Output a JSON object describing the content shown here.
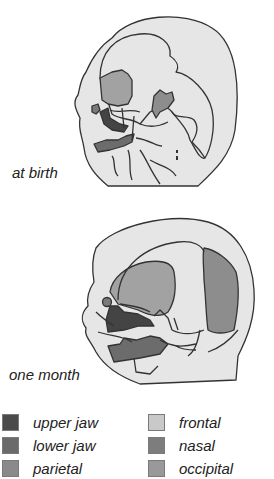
{
  "figure": {
    "stages": [
      {
        "id": "birth",
        "caption": "at birth"
      },
      {
        "id": "month",
        "caption": "one month"
      }
    ]
  },
  "legend": {
    "items": [
      {
        "label": "upper jaw",
        "color": "#4a4a4a"
      },
      {
        "label": "lower jaw",
        "color": "#6a6a6a"
      },
      {
        "label": "parietal",
        "color": "#8a8a8a"
      },
      {
        "label": "frontal",
        "color": "#c9c9c9"
      },
      {
        "label": "nasal",
        "color": "#7d7d7d"
      },
      {
        "label": "occipital",
        "color": "#999999"
      }
    ]
  },
  "colors": {
    "skull_fill": "#e6e6e6",
    "outline": "#333333",
    "frontal_region": "#9d9d9d",
    "temporal_region": "#8c8c8c",
    "occipital_region": "#8a8a8a"
  }
}
